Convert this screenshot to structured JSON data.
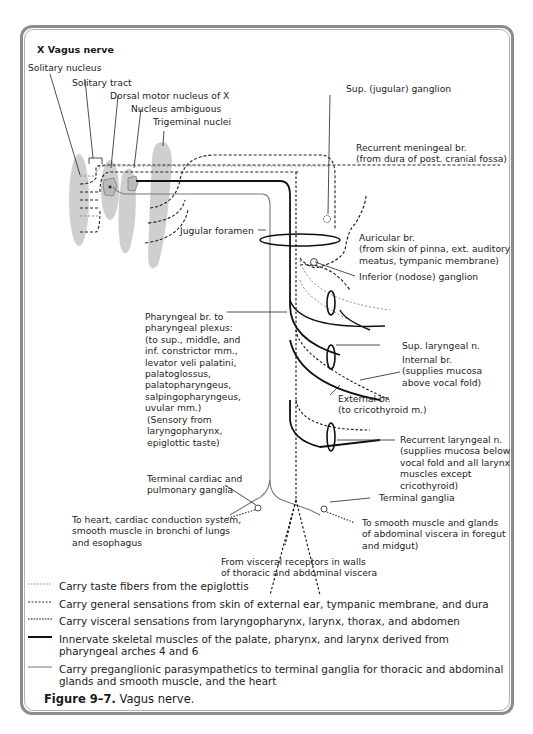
{
  "figure": {
    "title": "X  Vagus nerve",
    "caption_number": "Figure 9–7.",
    "caption_text": "Vagus nerve."
  },
  "nuclei_labels": {
    "solitary_nucleus": "Solitary nucleus",
    "solitary_tract": "Solitary tract",
    "dorsal_motor": "Dorsal motor nucleus of X",
    "nucleus_ambiguous": "Nucleus ambiguous",
    "trigeminal": "Trigeminal nuclei"
  },
  "labels": {
    "jugular_foramen": "Jugular foramen",
    "sup_ganglion": "Sup. (jugular) ganglion",
    "recurrent_meningeal": [
      "Recurrent meningeal br.",
      "(from dura of post. cranial fossa)"
    ],
    "auricular": [
      "Auricular br.",
      "(from skin of pinna, ext. auditory",
      "meatus, tympanic membrane)"
    ],
    "inferior_ganglion": "Inferior (nodose) ganglion",
    "pharyngeal": [
      "Pharyngeal br. to",
      "pharyngeal plexus:",
      "(to sup., middle, and",
      "inf. constrictor mm.,",
      "levator veli palatini,",
      "palatoglossus,",
      "palatopharyngeus,",
      "salpingopharyngeus,",
      "uvular mm.)"
    ],
    "pharyngeal_sensory": [
      "(Sensory from",
      "laryngopharynx,",
      "epiglottic taste)"
    ],
    "sup_laryngeal": "Sup. laryngeal n.",
    "internal_br": [
      "Internal br.",
      "(supplies mucosa",
      "above vocal fold)"
    ],
    "external_br": [
      "External br.",
      "(to cricothyroid m.)"
    ],
    "recurrent_laryngeal": [
      "Recurrent laryngeal n.",
      "(supplies mucosa below",
      "vocal fold and all larynx",
      "muscles except",
      "cricothyroid)"
    ],
    "terminal_cardiac": [
      "Terminal cardiac and",
      "pulmonary ganglia"
    ],
    "to_heart": [
      "To heart,  cardiac conduction system,",
      "smooth muscle in bronchi of lungs",
      "and esophagus"
    ],
    "terminal_ganglia": "Terminal ganglia",
    "to_smooth": [
      "To smooth muscle and glands",
      "of abdominal viscera in foregut",
      "and midgut)"
    ],
    "visceral_receptors": [
      "From visceral receptors in walls",
      "of thoracic and abdominal viscera"
    ]
  },
  "legend": [
    {
      "style": "fine-dotted-gray",
      "text": "Carry taste fibers from the epiglottis"
    },
    {
      "style": "dashed-dark",
      "text": "Carry general sensations from skin of external ear, tympanic membrane, and dura"
    },
    {
      "style": "dashed-black",
      "text": "Carry visceral sensations from laryngopharynx, larynx, thorax, and abdomen"
    },
    {
      "style": "thick-solid",
      "text": "Innervate skeletal muscles of the palate, pharynx, and larynx derived from pharyngeal arches 4 and 6"
    },
    {
      "style": "thin-solid-gray",
      "text": "Carry preganglionic parasympathetics to terminal ganglia for thoracic and abdominal glands and smooth muscle, and the heart"
    }
  ],
  "colors": {
    "frame": "#8c8c8c",
    "nucleus_fill": "#cfcfcf",
    "ink": "#1a1a1a",
    "gray_line": "#8a8a8a"
  }
}
